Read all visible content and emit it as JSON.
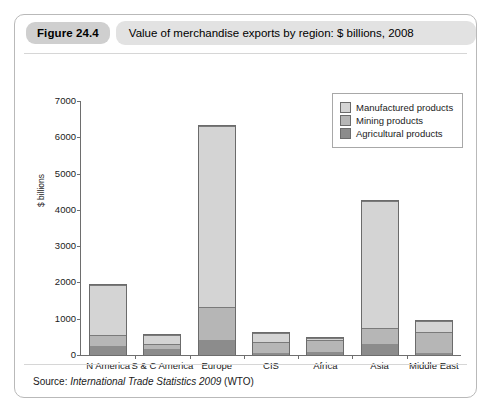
{
  "figure": {
    "number": "Figure 24.4",
    "title": "Value of merchandise exports by region: $ billions, 2008",
    "source_prefix": "Source:",
    "source_title": "International Trade Statistics 2009",
    "source_suffix": "(WTO)"
  },
  "legend": {
    "items": [
      {
        "label": "Manufactured products",
        "color": "#d4d4d4"
      },
      {
        "label": "Mining products",
        "color": "#b6b6b6"
      },
      {
        "label": "Agricultural products",
        "color": "#8c8c8c"
      }
    ]
  },
  "chart_data": {
    "type": "bar",
    "stacked": true,
    "title": "Value of merchandise exports by region: $ billions, 2008",
    "xlabel": "",
    "ylabel": "$ billions",
    "ylim": [
      0,
      7000
    ],
    "yticks": [
      0,
      1000,
      2000,
      3000,
      4000,
      5000,
      6000,
      7000
    ],
    "ytick_labels": [
      "0",
      "1000",
      "2000",
      "3000",
      "4000",
      "5000",
      "6000",
      "7000"
    ],
    "grid": false,
    "legend_position": "top-right",
    "categories": [
      "N America",
      "S & C America",
      "Europe",
      "CIS",
      "Africa",
      "Asia",
      "Middle East"
    ],
    "series": [
      {
        "name": "Agricultural products",
        "color": "#8c8c8c",
        "values": [
          250,
          170,
          410,
          70,
          90,
          300,
          60
        ]
      },
      {
        "name": "Mining products",
        "color": "#b6b6b6",
        "values": [
          300,
          160,
          910,
          310,
          340,
          440,
          600
        ]
      },
      {
        "name": "Manufactured products",
        "color": "#d4d4d4",
        "values": [
          1410,
          250,
          5030,
          260,
          60,
          3520,
          300
        ]
      }
    ],
    "totals": [
      1960,
      580,
      6350,
      640,
      490,
      4260,
      960
    ]
  }
}
